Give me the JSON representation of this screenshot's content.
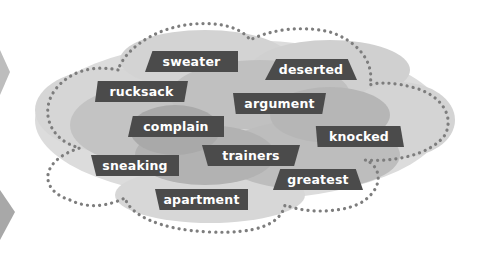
{
  "diagram": {
    "type": "word-cloud",
    "colors": {
      "label_bg": "#4b4b4b",
      "label_text": "#ffffff",
      "blob_light": "#d9d9d9",
      "blob_mid": "#c4c4c4",
      "blob_dark": "#ababab",
      "dots": "#7a7a7a"
    },
    "words": [
      {
        "text": "sweater"
      },
      {
        "text": "deserted"
      },
      {
        "text": "rucksack"
      },
      {
        "text": "argument"
      },
      {
        "text": "complain"
      },
      {
        "text": "knocked"
      },
      {
        "text": "trainers"
      },
      {
        "text": "sneaking"
      },
      {
        "text": "greatest"
      },
      {
        "text": "apartment"
      }
    ]
  }
}
